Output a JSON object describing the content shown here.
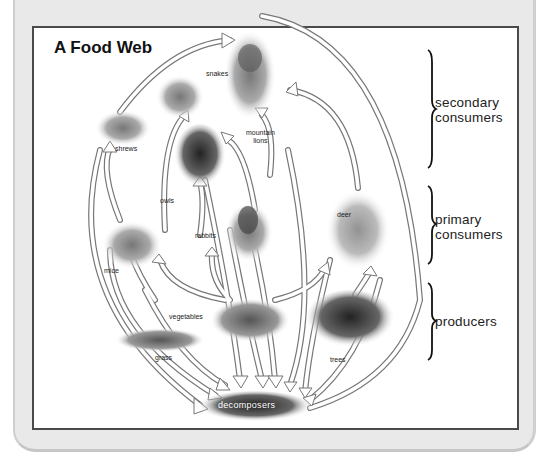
{
  "title": "A Food Web",
  "levels": [
    {
      "name": "secondary",
      "label_line1": "secondary",
      "label_line2": "consumers"
    },
    {
      "name": "primary",
      "label_line1": "primary",
      "label_line2": "consumers"
    },
    {
      "name": "producers",
      "label_line1": "producers",
      "label_line2": ""
    }
  ],
  "organisms": {
    "snakes": "snakes",
    "shrews": "shrews",
    "mountain_lions_1": "mountain",
    "mountain_lions_2": "lions",
    "owls": "owls",
    "rabbits": "rabbits",
    "deer": "deer",
    "mice": "mice",
    "vegetables": "vegetables",
    "grass": "grass",
    "trees": "trees",
    "decomposers": "decomposers"
  },
  "diagram_data": {
    "type": "food_web",
    "nodes": [
      {
        "id": "mountain lions",
        "level": "secondary consumers"
      },
      {
        "id": "snakes",
        "level": "secondary consumers"
      },
      {
        "id": "shrews",
        "level": "secondary consumers"
      },
      {
        "id": "owls",
        "level": "secondary consumers"
      },
      {
        "id": "rabbits",
        "level": "primary consumers"
      },
      {
        "id": "deer",
        "level": "primary consumers"
      },
      {
        "id": "mice",
        "level": "primary consumers"
      },
      {
        "id": "vegetables",
        "level": "producers"
      },
      {
        "id": "grass",
        "level": "producers"
      },
      {
        "id": "trees",
        "level": "producers"
      },
      {
        "id": "decomposers",
        "level": "decomposers"
      }
    ],
    "edges": [
      [
        "shrews",
        "mountain lions"
      ],
      [
        "snakes",
        "mountain lions"
      ],
      [
        "rabbits",
        "mountain lions"
      ],
      [
        "deer",
        "mountain lions"
      ],
      [
        "mice",
        "shrews"
      ],
      [
        "mice",
        "snakes"
      ],
      [
        "rabbits",
        "snakes"
      ],
      [
        "rabbits",
        "owls"
      ],
      [
        "mice",
        "owls"
      ],
      [
        "grass",
        "mice"
      ],
      [
        "vegetables",
        "mice"
      ],
      [
        "vegetables",
        "rabbits"
      ],
      [
        "vegetables",
        "deer"
      ],
      [
        "trees",
        "deer"
      ],
      [
        "shrews",
        "decomposers"
      ],
      [
        "mice",
        "decomposers"
      ],
      [
        "grass",
        "decomposers"
      ],
      [
        "snakes",
        "decomposers"
      ],
      [
        "owls",
        "decomposers"
      ],
      [
        "rabbits",
        "decomposers"
      ],
      [
        "vegetables",
        "decomposers"
      ],
      [
        "mountain lions",
        "decomposers"
      ],
      [
        "deer",
        "decomposers"
      ],
      [
        "trees",
        "decomposers"
      ]
    ]
  }
}
